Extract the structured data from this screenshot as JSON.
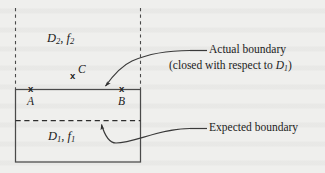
{
  "figure": {
    "background_color": "#efefed",
    "ink_color": "#3a3a3a",
    "text_color": "#1c1c1c"
  },
  "regions": {
    "upper": {
      "name": "D2, f2",
      "domain_symbol": "D",
      "domain_subscript": "2",
      "function_symbol": "f",
      "function_subscript": "2",
      "separator": ", "
    },
    "lower": {
      "name": "D1, f1",
      "domain_symbol": "D",
      "domain_subscript": "1",
      "function_symbol": "f",
      "function_subscript": "1",
      "separator": ", "
    }
  },
  "points": [
    {
      "id": "A",
      "label": "A",
      "marker": "x",
      "marker_x": 31,
      "marker_y": 89,
      "label_x": 27,
      "label_y": 100
    },
    {
      "id": "C",
      "label": "C",
      "marker": "x",
      "marker_x": 73,
      "marker_y": 76,
      "label_x": 79,
      "label_y": 70
    },
    {
      "id": "B",
      "label": "B",
      "marker": "x",
      "marker_x": 122,
      "marker_y": 89,
      "label_x": 118,
      "label_y": 100
    }
  ],
  "callouts": [
    {
      "id": "actual-boundary",
      "line1": "Actual boundary",
      "line2_prefix": "(closed with respect to ",
      "line2_symbol": "D",
      "line2_subscript": "1",
      "line2_suffix": ")",
      "line1_x": 209,
      "line1_y": 50,
      "line2_x": 169,
      "line2_y": 66
    },
    {
      "id": "expected-boundary",
      "line1": "Expected boundary",
      "line1_x": 209,
      "line1_y": 128
    }
  ],
  "geometry": {
    "rect": {
      "x": 15,
      "y": 89,
      "width": 125,
      "height": 73
    },
    "dashed_vertical_left": {
      "x": 15,
      "y_top": 8,
      "y_bottom": 89
    },
    "dashed_vertical_right": {
      "x": 140,
      "y_top": 8,
      "y_bottom": 89
    },
    "dashed_horizontal": {
      "x_left": 15,
      "x_right": 140,
      "y": 120
    },
    "leader_actual": {
      "x1": 190,
      "y1": 50,
      "x2": 207,
      "y2": 50
    },
    "leader_expected": {
      "x1": 190,
      "y1": 128,
      "x2": 207,
      "y2": 128
    }
  }
}
